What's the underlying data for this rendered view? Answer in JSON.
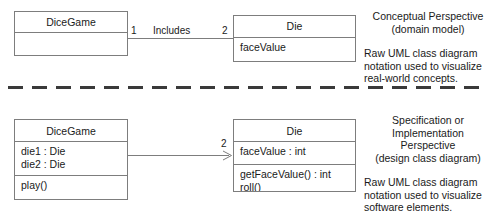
{
  "diagram": {
    "colors": {
      "box_border": "#7d7d7d",
      "line": "#7d7d7d",
      "separator": "#3a3a3a",
      "text": "#1a1a1a",
      "background": "#ffffff"
    }
  },
  "conceptual": {
    "dicegame": {
      "name": "DiceGame",
      "attributes": [],
      "operations": []
    },
    "die": {
      "name": "Die",
      "attributes": [
        "faceValue"
      ],
      "operations": []
    },
    "association": {
      "source_multiplicity": "1",
      "label": "Includes",
      "target_multiplicity": "2"
    },
    "annotation": {
      "heading_lines": [
        "Conceptual Perspective",
        "(domain model)"
      ],
      "body_lines": [
        "Raw UML class diagram",
        "notation used to visualize",
        "real-world concepts."
      ]
    }
  },
  "specification": {
    "dicegame": {
      "name": "DiceGame",
      "attributes": [
        "die1 : Die",
        "die2 : Die"
      ],
      "operations": [
        "play()"
      ]
    },
    "die": {
      "name": "Die",
      "attributes": [
        "faceValue : int"
      ],
      "operations": [
        "getFaceValue() : int",
        "roll()"
      ]
    },
    "association": {
      "source_multiplicity": "",
      "label": "",
      "target_multiplicity": "2"
    },
    "annotation": {
      "heading_lines": [
        "Specification or",
        "Implementation",
        "Perspective",
        "(design class diagram)"
      ],
      "body_lines": [
        "Raw UML class diagram",
        "notation used to visualize",
        "software elements."
      ]
    }
  }
}
